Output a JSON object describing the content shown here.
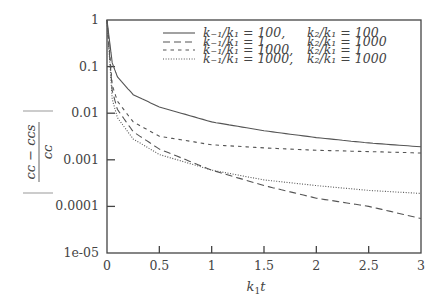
{
  "chart_data": {
    "type": "line",
    "title": "",
    "xlabel": "k1 t",
    "ylabel": "|(cC - cCs) / cC|",
    "xlim": [
      0,
      3
    ],
    "ylim": [
      1e-05,
      1
    ],
    "yscale": "log",
    "grid": false,
    "legend_position": "upper right",
    "x_ticks": [
      "0",
      "0.5",
      "1",
      "1.5",
      "2",
      "2.5",
      "3"
    ],
    "y_ticks": [
      "1",
      "0.1",
      "0.01",
      "0.001",
      "0.0001",
      "1e-05"
    ],
    "x": [
      0,
      0.05,
      0.1,
      0.25,
      0.5,
      1,
      1.5,
      2,
      2.5,
      3
    ],
    "series": [
      {
        "name": "k-1/k1 = 100, k2/k1 = 100",
        "style": "solid",
        "values": [
          1,
          0.12,
          0.06,
          0.025,
          0.0136,
          0.0065,
          0.0042,
          0.003,
          0.0023,
          0.0019
        ]
      },
      {
        "name": "k-1/k1 = 1, k2/k1 = 1000",
        "style": "long-dash",
        "values": [
          1,
          0.03,
          0.012,
          0.004,
          0.0017,
          0.0006,
          0.00028,
          0.00015,
          0.0001,
          5.5e-05
        ]
      },
      {
        "name": "k-1/k1 = 1000, k2/k1 = 1",
        "style": "short-dash",
        "values": [
          1,
          0.04,
          0.018,
          0.0065,
          0.0032,
          0.0021,
          0.0018,
          0.0016,
          0.0015,
          0.0014
        ]
      },
      {
        "name": "k-1/k1 = 1000, k2/k1 = 1000",
        "style": "dotted",
        "values": [
          1,
          0.02,
          0.008,
          0.0028,
          0.0013,
          0.0006,
          0.00037,
          0.00028,
          0.00022,
          0.00019
        ]
      }
    ]
  },
  "legend": [
    {
      "left": "k₋₁/k₁ = 100,",
      "right": "k₂/k₁ = 100"
    },
    {
      "left": "k₋₁/k₁ = 1,",
      "right": "k₂/k₁ = 1000"
    },
    {
      "left": "k₋₁/k₁ = 1000,",
      "right": "k₂/k₁ = 1"
    },
    {
      "left": "k₋₁/k₁ = 1000,",
      "right": "k₂/k₁ = 1000"
    }
  ],
  "axes": {
    "xlabel_main": "k",
    "xlabel_sub": "1",
    "xlabel_tail": "t",
    "ylabel_num": "cᴄ − cᴄs",
    "ylabel_den": "cᴄ"
  },
  "colors": {
    "line": "#555555",
    "axis": "#444444"
  }
}
